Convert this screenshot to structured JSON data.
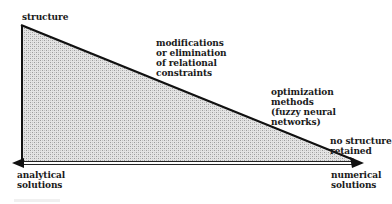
{
  "diagram": {
    "labels": {
      "top_vertex": "structure",
      "mid_upper": "modifications\nor elimination\nof relational\nconstraints",
      "mid_lower": "optimization\nmethods\n(fuzzy neural\nnetworks)",
      "right_end_top": "no structure\nretained",
      "axis_left": "analytical\nsolutions",
      "axis_right": "numerical\nsolutions"
    },
    "shapes": {
      "triangle": {
        "apex": [
          22,
          26
        ],
        "bottom_left": [
          22,
          162
        ],
        "bottom_right": [
          352,
          162
        ],
        "fill": "#d6d6d6",
        "stroke": "#111111"
      },
      "axis": {
        "type": "double-headed double-line arrow",
        "from": [
          14,
          163
        ],
        "to": [
          362,
          163
        ],
        "color": "#111111"
      }
    },
    "colors": {
      "fill_pattern_light": "#e8e8e8",
      "fill_pattern_dark": "#bdbdbd",
      "stroke": "#111111"
    }
  }
}
